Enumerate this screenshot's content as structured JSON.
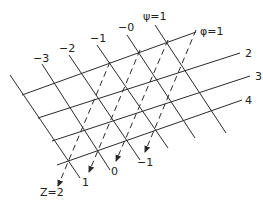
{
  "figure": {
    "phi_lines": [
      {
        "label": "φ=1",
        "x1": 22,
        "y1": 95,
        "x2": 196,
        "y2": 32,
        "lx": 200,
        "ly": 35
      },
      {
        "label": "2",
        "x1": 38,
        "y1": 118,
        "x2": 240,
        "y2": 53,
        "lx": 245,
        "ly": 57
      },
      {
        "label": "3",
        "x1": 52,
        "y1": 141,
        "x2": 250,
        "y2": 76,
        "lx": 255,
        "ly": 80
      },
      {
        "label": "4",
        "x1": 57,
        "y1": 165,
        "x2": 242,
        "y2": 100,
        "lx": 245,
        "ly": 104
      }
    ],
    "psi_lines": [
      {
        "label": "",
        "x1": 10,
        "y1": 75,
        "x2": 80,
        "y2": 178,
        "lx": 0,
        "ly": 0
      },
      {
        "label": "−3",
        "x1": 42,
        "y1": 64,
        "x2": 110,
        "y2": 170,
        "lx": 33,
        "ly": 62
      },
      {
        "label": "−2",
        "x1": 69,
        "y1": 55,
        "x2": 140,
        "y2": 160,
        "lx": 59,
        "ly": 52
      },
      {
        "label": "−1",
        "x1": 97,
        "y1": 45,
        "x2": 168,
        "y2": 148,
        "lx": 90,
        "ly": 42
      },
      {
        "label": "−0",
        "x1": 127,
        "y1": 35,
        "x2": 195,
        "y2": 138,
        "lx": 118,
        "ly": 31
      },
      {
        "label": "ψ=1",
        "x1": 155,
        "y1": 25,
        "x2": 226,
        "y2": 133,
        "lx": 143,
        "ly": 20
      }
    ],
    "z_lines": [
      {
        "label": "Z=2",
        "x1": 110,
        "y1": 62,
        "x2": 58,
        "y2": 186,
        "lx": 40,
        "ly": 196
      },
      {
        "label": "1",
        "x1": 140,
        "y1": 50,
        "x2": 89,
        "y2": 172,
        "lx": 82,
        "ly": 186
      },
      {
        "label": "0",
        "x1": 168,
        "y1": 40,
        "x2": 116,
        "y2": 161,
        "lx": 111,
        "ly": 175
      },
      {
        "label": "−1",
        "x1": 196,
        "y1": 30,
        "x2": 145,
        "y2": 152,
        "lx": 137,
        "ly": 166
      }
    ]
  }
}
